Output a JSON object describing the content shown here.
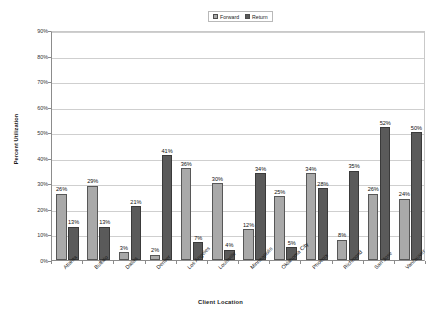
{
  "chart_data": {
    "type": "bar",
    "title": "",
    "xlabel": "Client Location",
    "ylabel": "Percent Utilization",
    "ylim": [
      0,
      90
    ],
    "ytick_labels": [
      "90%",
      "80%",
      "70%",
      "60%",
      "50%",
      "40%",
      "30%",
      "20%",
      "10%",
      "0%"
    ],
    "ytick_values": [
      90,
      80,
      70,
      60,
      50,
      40,
      30,
      20,
      10,
      0
    ],
    "grid": true,
    "legend_position": "top-center",
    "value_suffix": "%",
    "categories": [
      "Atlanta",
      "Buffalo",
      "Dallas",
      "Denver",
      "Los Angeles",
      "Louisville",
      "Minneapolis",
      "Oklahoma City",
      "Phoenix",
      "Richmond",
      "San Jose",
      "Vancouver"
    ],
    "series": [
      {
        "name": "Forward",
        "color": "#a9a9a9",
        "values": [
          26,
          29,
          3,
          2,
          36,
          30,
          12,
          25,
          34,
          8,
          26,
          24
        ],
        "labels": [
          "26%",
          "29%",
          "3%",
          "2%",
          "36%",
          "30%",
          "12%",
          "25%",
          "34%",
          "8%",
          "26%",
          "24%"
        ]
      },
      {
        "name": "Return",
        "color": "#5a5a5a",
        "values": [
          13,
          13,
          21,
          41,
          7,
          4,
          34,
          5,
          28,
          35,
          52,
          50
        ],
        "labels": [
          "13%",
          "13%",
          "21%",
          "41%",
          "7%",
          "4%",
          "34%",
          "5%",
          "28%",
          "35%",
          "52%",
          "50%"
        ]
      }
    ]
  },
  "legend": {
    "items": [
      {
        "label": "Forward",
        "color": "#a9a9a9"
      },
      {
        "label": "Return",
        "color": "#5a5a5a"
      }
    ]
  }
}
